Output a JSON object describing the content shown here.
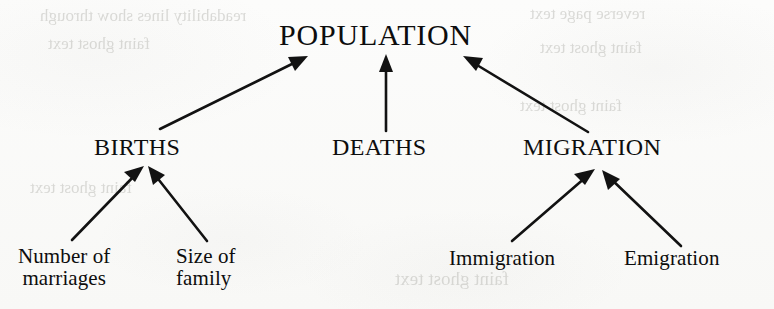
{
  "diagram": {
    "title": "POPULATION",
    "type": "hierarchical-tree",
    "root": {
      "label": "POPULATION"
    },
    "level2": [
      {
        "label": "BIRTHS"
      },
      {
        "label": "DEATHS"
      },
      {
        "label": "MIGRATION"
      }
    ],
    "level3": [
      {
        "line1": "Number of",
        "line2": "marriages",
        "parent": "BIRTHS"
      },
      {
        "line1": "Size of",
        "line2": "family",
        "parent": "BIRTHS"
      },
      {
        "line1": "Immigration",
        "line2": "",
        "parent": "MIGRATION"
      },
      {
        "line1": "Emigration",
        "line2": "",
        "parent": "MIGRATION"
      }
    ],
    "edges": [
      {
        "from": "BIRTHS",
        "to": "POPULATION"
      },
      {
        "from": "DEATHS",
        "to": "POPULATION"
      },
      {
        "from": "MIGRATION",
        "to": "POPULATION"
      },
      {
        "from": "Number of marriages",
        "to": "BIRTHS"
      },
      {
        "from": "Size of family",
        "to": "BIRTHS"
      },
      {
        "from": "Immigration",
        "to": "MIGRATION"
      },
      {
        "from": "Emigration",
        "to": "MIGRATION"
      }
    ],
    "colors": {
      "ink": "#121212",
      "paper": "#fbfbfa",
      "showthrough": "#b9b9b4"
    },
    "showthrough": {
      "line_top_left": "readability lines show through",
      "line_top_right": "reverse page text",
      "line_mid_left": "faint ghost text",
      "line_mid_right": "faint ghost text",
      "line_low_left": "faint ghost text",
      "line_low_right": "faint ghost text",
      "line_bottom": "faint ghost text"
    }
  }
}
